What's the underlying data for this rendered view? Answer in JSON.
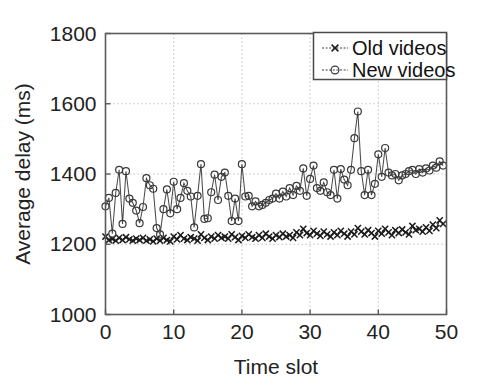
{
  "chart_data": {
    "type": "line",
    "title": "",
    "xlabel": "Time slot",
    "ylabel": "Average delay (ms)",
    "xlim": [
      0,
      50
    ],
    "ylim": [
      1000,
      1800
    ],
    "xticks": [
      0,
      10,
      20,
      30,
      40,
      50
    ],
    "yticks": [
      1000,
      1200,
      1400,
      1600,
      1800
    ],
    "xtick_labels": [
      "0",
      "10",
      "20",
      "30",
      "40",
      "50"
    ],
    "ytick_labels": [
      "1000",
      "1200",
      "1400",
      "1600",
      "1800"
    ],
    "grid": true,
    "grid_style": "dotted",
    "legend_position": "top-right",
    "x": [
      0,
      0.5,
      1,
      1.5,
      2,
      2.5,
      3,
      3.5,
      4,
      4.5,
      5,
      5.5,
      6,
      6.5,
      7,
      7.5,
      8,
      8.5,
      9,
      9.5,
      10,
      10.5,
      11,
      11.5,
      12,
      12.5,
      13,
      13.5,
      14,
      14.5,
      15,
      15.5,
      16,
      16.5,
      17,
      17.5,
      18,
      18.5,
      19,
      19.5,
      20,
      20.5,
      21,
      21.5,
      22,
      22.5,
      23,
      23.5,
      24,
      24.5,
      25,
      25.5,
      26,
      26.5,
      27,
      27.5,
      28,
      28.5,
      29,
      29.5,
      30,
      30.5,
      31,
      31.5,
      32,
      32.5,
      33,
      33.5,
      34,
      34.5,
      35,
      35.5,
      36,
      36.5,
      37,
      37.5,
      38,
      38.5,
      39,
      39.5,
      40,
      40.5,
      41,
      41.5,
      42,
      42.5,
      43,
      43.5,
      44,
      44.5,
      45,
      45.5,
      46,
      46.5,
      47,
      47.5,
      48,
      48.5,
      49,
      49.5
    ],
    "series": [
      {
        "name": "Old videos",
        "marker": "x",
        "color": "#1d1d1d",
        "values": [
          1222,
          1212,
          1215,
          1210,
          1218,
          1212,
          1220,
          1214,
          1210,
          1216,
          1212,
          1218,
          1210,
          1214,
          1208,
          1216,
          1210,
          1218,
          1212,
          1208,
          1222,
          1214,
          1226,
          1216,
          1212,
          1220,
          1216,
          1210,
          1228,
          1218,
          1212,
          1222,
          1216,
          1226,
          1218,
          1222,
          1216,
          1228,
          1220,
          1212,
          1224,
          1218,
          1228,
          1220,
          1216,
          1226,
          1218,
          1230,
          1222,
          1216,
          1226,
          1220,
          1230,
          1222,
          1226,
          1218,
          1234,
          1226,
          1244,
          1232,
          1226,
          1238,
          1230,
          1224,
          1236,
          1228,
          1222,
          1234,
          1226,
          1238,
          1230,
          1222,
          1236,
          1228,
          1246,
          1236,
          1228,
          1240,
          1232,
          1222,
          1238,
          1230,
          1244,
          1234,
          1226,
          1240,
          1232,
          1242,
          1234,
          1228,
          1252,
          1240,
          1244,
          1236,
          1248,
          1238,
          1256,
          1246,
          1268,
          1258
        ]
      },
      {
        "name": "New videos",
        "marker": "o",
        "color": "#3a3a3a",
        "values": [
          1308,
          1332,
          1230,
          1346,
          1412,
          1258,
          1408,
          1330,
          1318,
          1296,
          1260,
          1306,
          1388,
          1368,
          1358,
          1246,
          1228,
          1300,
          1356,
          1288,
          1378,
          1300,
          1332,
          1374,
          1352,
          1336,
          1248,
          1338,
          1428,
          1272,
          1274,
          1348,
          1398,
          1326,
          1392,
          1404,
          1338,
          1266,
          1330,
          1266,
          1428,
          1336,
          1338,
          1308,
          1322,
          1308,
          1312,
          1318,
          1326,
          1330,
          1344,
          1330,
          1350,
          1336,
          1360,
          1340,
          1366,
          1352,
          1416,
          1338,
          1386,
          1424,
          1360,
          1352,
          1376,
          1348,
          1340,
          1412,
          1330,
          1414,
          1384,
          1368,
          1412,
          1502,
          1578,
          1408,
          1340,
          1412,
          1340,
          1372,
          1456,
          1392,
          1474,
          1404,
          1396,
          1400,
          1382,
          1396,
          1400,
          1408,
          1412,
          1400,
          1414,
          1404,
          1416,
          1410,
          1424,
          1418,
          1436,
          1424
        ]
      }
    ]
  },
  "legend": {
    "items": [
      {
        "label": "Old videos",
        "marker": "x"
      },
      {
        "label": "New videos",
        "marker": "o"
      }
    ]
  }
}
